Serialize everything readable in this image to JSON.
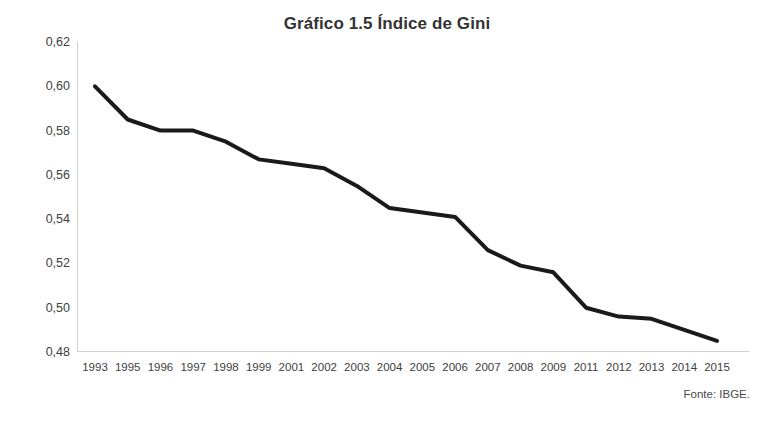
{
  "chart_data": {
    "type": "line",
    "title": "Gráfico 1.5 Índice de Gini",
    "xlabel": "",
    "ylabel": "",
    "categories": [
      "1993",
      "1995",
      "1996",
      "1997",
      "1998",
      "1999",
      "2001",
      "2002",
      "2003",
      "2004",
      "2005",
      "2006",
      "2007",
      "2008",
      "2009",
      "2011",
      "2012",
      "2013",
      "2014",
      "2015"
    ],
    "values": [
      0.6,
      0.585,
      0.58,
      0.58,
      0.575,
      0.567,
      0.565,
      0.563,
      0.555,
      0.545,
      0.543,
      0.541,
      0.526,
      0.519,
      0.516,
      0.5,
      0.496,
      0.495,
      0.49,
      0.485
    ],
    "series": [
      {
        "name": "Índice de Gini",
        "color": "#1a1a1a",
        "values": [
          0.6,
          0.585,
          0.58,
          0.58,
          0.575,
          0.567,
          0.565,
          0.563,
          0.555,
          0.545,
          0.543,
          0.541,
          0.526,
          0.519,
          0.516,
          0.5,
          0.496,
          0.495,
          0.49,
          0.485
        ]
      }
    ],
    "ylim": [
      0.48,
      0.62
    ],
    "ytick_step": 0.02,
    "ytick_labels": [
      "0,62",
      "0,60",
      "0,58",
      "0,56",
      "0,54",
      "0,52",
      "0,50",
      "0,48"
    ],
    "ytick_values": [
      0.62,
      0.6,
      0.58,
      0.56,
      0.54,
      0.52,
      0.5,
      0.48
    ],
    "grid": false,
    "legend": "none",
    "decimal_separator": ",",
    "omitted_years": [
      "1994",
      "2000",
      "2010"
    ]
  },
  "footer": {
    "source": "Fonte: IBGE."
  },
  "style": {
    "line_color": "#1a1a1a",
    "axis_color": "#d2d2d2",
    "text_color": "#404040",
    "title_color": "#333333",
    "background": "#ffffff"
  }
}
